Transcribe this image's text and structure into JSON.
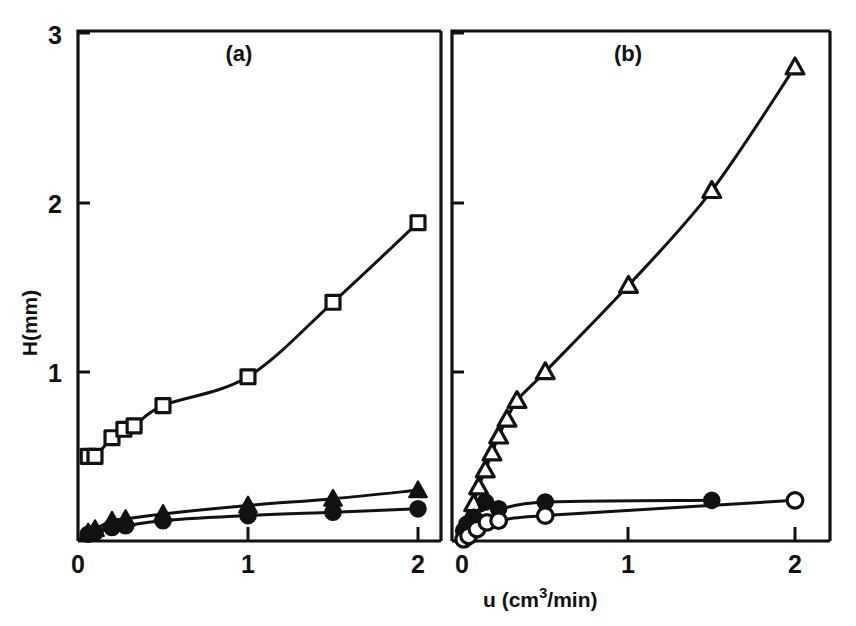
{
  "figure": {
    "background_color": "#ffffff",
    "ink_color": "#111111",
    "axis_labels": {
      "x": "u (cm",
      "x_superscript": "3",
      "x_suffix": "/min)",
      "x_full": "u (cm3/min)",
      "y": "H(mm)"
    },
    "panels": [
      {
        "key": "a",
        "label": "(a)"
      },
      {
        "key": "b",
        "label": "(b)"
      }
    ],
    "x_ticks": [
      "0",
      "1",
      "2"
    ],
    "y_ticks": [
      "0",
      "1",
      "2",
      "3"
    ]
  },
  "chart_data": [
    {
      "type": "scatter",
      "panel": "(a)",
      "title": "(a)",
      "xlabel": "u (cm3/min)",
      "ylabel": "H(mm)",
      "xlim": [
        0,
        2.15
      ],
      "ylim": [
        0,
        3
      ],
      "xticks": [
        0,
        1,
        2
      ],
      "yticks": [
        0,
        1,
        2,
        3
      ],
      "grid": false,
      "legend": "none",
      "series": [
        {
          "name": "open-square",
          "marker": "square",
          "fill": "open",
          "line": true,
          "x": [
            0.06,
            0.1,
            0.2,
            0.27,
            0.33,
            0.5,
            1.0,
            1.5,
            2.0
          ],
          "y": [
            0.5,
            0.5,
            0.61,
            0.66,
            0.68,
            0.8,
            0.97,
            1.41,
            1.88
          ]
        },
        {
          "name": "filled-triangle",
          "marker": "triangle",
          "fill": "filled",
          "line": true,
          "x": [
            0.06,
            0.1,
            0.2,
            0.28,
            0.5,
            1.0,
            1.5,
            2.0
          ],
          "y": [
            0.05,
            0.07,
            0.12,
            0.13,
            0.16,
            0.21,
            0.25,
            0.3
          ]
        },
        {
          "name": "filled-circle",
          "marker": "circle",
          "fill": "filled",
          "line": true,
          "x": [
            0.06,
            0.1,
            0.2,
            0.28,
            0.5,
            1.0,
            1.5,
            2.0
          ],
          "y": [
            0.04,
            0.05,
            0.08,
            0.09,
            0.12,
            0.15,
            0.17,
            0.19
          ]
        }
      ]
    },
    {
      "type": "scatter",
      "panel": "(b)",
      "title": "(b)",
      "xlabel": "u (cm3/min)",
      "ylabel": "H(mm)",
      "xlim": [
        0,
        2.15
      ],
      "ylim": [
        0,
        3
      ],
      "xticks": [
        0,
        1,
        2
      ],
      "yticks": [
        0,
        1,
        2,
        3
      ],
      "grid": false,
      "legend": "none",
      "series": [
        {
          "name": "open-triangle",
          "marker": "triangle",
          "fill": "open",
          "line": true,
          "x": [
            0.015,
            0.04,
            0.07,
            0.1,
            0.14,
            0.18,
            0.22,
            0.27,
            0.33,
            0.5,
            1.0,
            1.5,
            2.0
          ],
          "y": [
            0.04,
            0.12,
            0.22,
            0.32,
            0.42,
            0.52,
            0.62,
            0.72,
            0.83,
            1.0,
            1.51,
            2.07,
            2.8
          ]
        },
        {
          "name": "filled-circle",
          "marker": "circle",
          "fill": "filled",
          "line": true,
          "x": [
            0.01,
            0.03,
            0.07,
            0.14,
            0.22,
            0.5,
            1.5
          ],
          "y": [
            0.06,
            0.1,
            0.14,
            0.23,
            0.19,
            0.23,
            0.24
          ]
        },
        {
          "name": "open-circle",
          "marker": "circle",
          "fill": "open",
          "line": true,
          "x": [
            0.01,
            0.04,
            0.09,
            0.15,
            0.22,
            0.5,
            2.0
          ],
          "y": [
            0.01,
            0.03,
            0.07,
            0.11,
            0.12,
            0.15,
            0.24
          ]
        }
      ]
    }
  ]
}
